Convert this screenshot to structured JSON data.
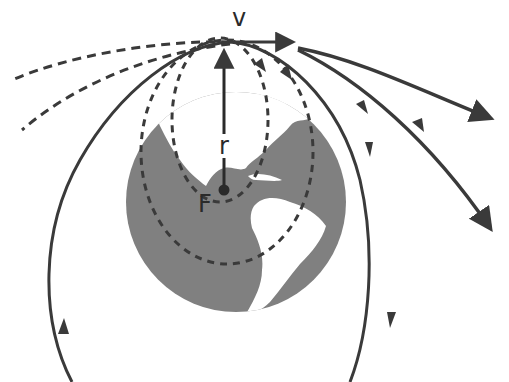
{
  "diagram": {
    "labels": {
      "velocity": "v",
      "radius": "r",
      "focus": "F"
    },
    "colors": {
      "earth": "#808080",
      "land": "#ffffff",
      "lines": "#3a3a3a",
      "background": "#ffffff"
    },
    "trajectories": [
      {
        "name": "inner-ellipse",
        "style": "dashed",
        "kind": "closed elliptical orbit with focus F"
      },
      {
        "name": "middle-ellipse",
        "style": "dashed",
        "kind": "closed elliptical orbit"
      },
      {
        "name": "circular-orbit",
        "style": "solid",
        "kind": "large closed orbit with direction arrows"
      },
      {
        "name": "left-dashed-upper",
        "style": "dashed",
        "kind": "retrograde hyperbolic branch"
      },
      {
        "name": "left-dashed-lower",
        "style": "dashed",
        "kind": "retrograde hyperbolic branch"
      },
      {
        "name": "escape-upper",
        "style": "solid",
        "kind": "hyperbolic escape trajectory"
      },
      {
        "name": "escape-lower",
        "style": "solid",
        "kind": "parabolic escape trajectory"
      }
    ]
  }
}
